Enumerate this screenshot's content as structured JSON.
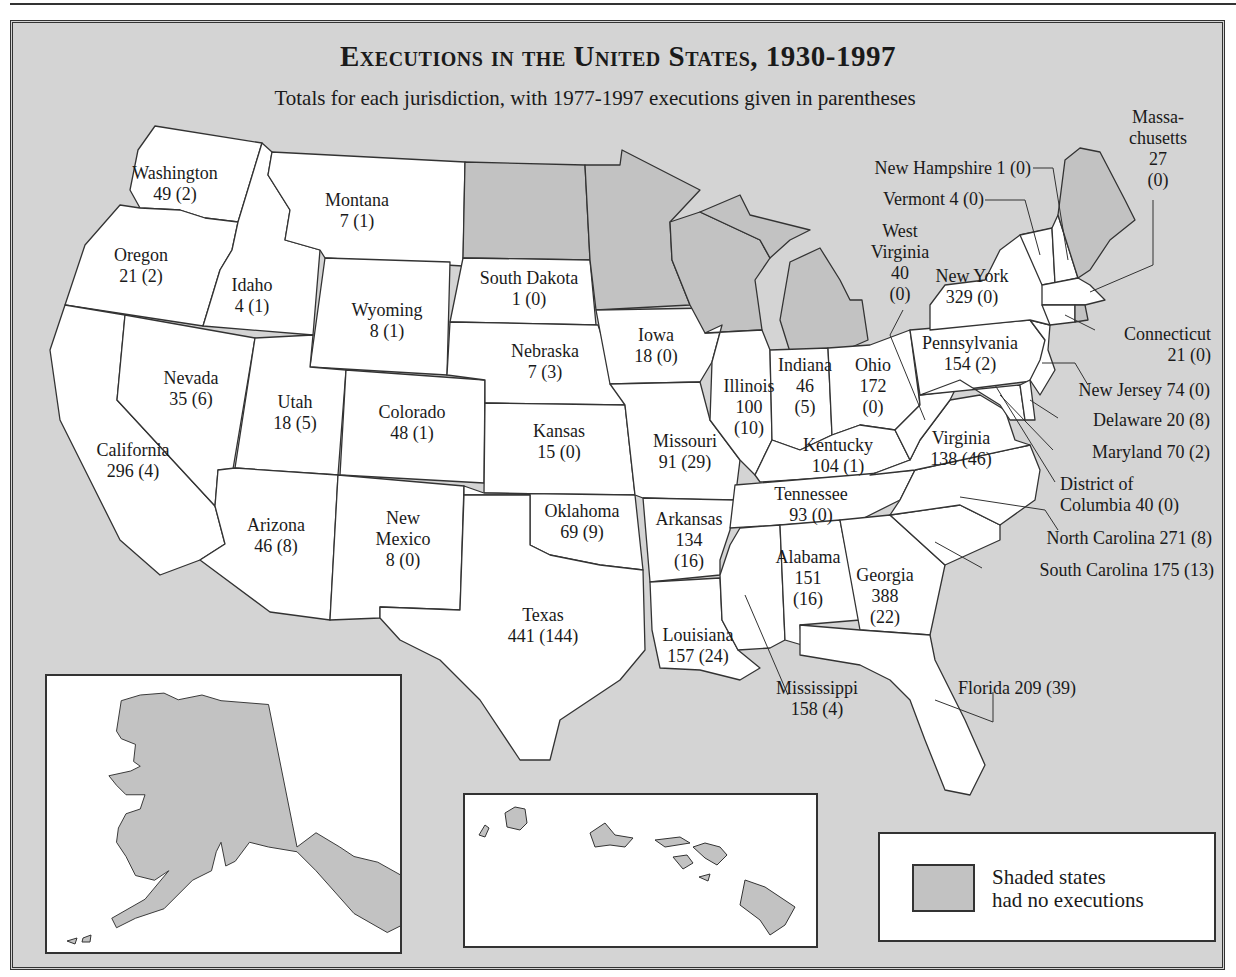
{
  "title": "Executions in the United States, 1930-1997",
  "subtitle": "Totals for each jurisdiction, with 1977-1997 executions given in parentheses",
  "legend": {
    "swatch_color": "#c2c2c2",
    "line1": "Shaded states",
    "line2": "had no executions"
  },
  "colors": {
    "background": "#d4d4d4",
    "state_fill": "#ffffff",
    "no_execution_fill": "#c2c2c2",
    "border": "#333333"
  },
  "states": {
    "washington": {
      "name": "Washington",
      "value": "49 (2)"
    },
    "oregon": {
      "name": "Oregon",
      "value": "21 (2)"
    },
    "california": {
      "name": "California",
      "value": "296 (4)"
    },
    "nevada": {
      "name": "Nevada",
      "value": "35 (6)"
    },
    "idaho": {
      "name": "Idaho",
      "value": "4 (1)"
    },
    "montana": {
      "name": "Montana",
      "value": "7 (1)"
    },
    "wyoming": {
      "name": "Wyoming",
      "value": "8 (1)"
    },
    "utah": {
      "name": "Utah",
      "value": "18 (5)"
    },
    "colorado": {
      "name": "Colorado",
      "value": "48 (1)"
    },
    "arizona": {
      "name": "Arizona",
      "value": "46 (8)"
    },
    "new_mexico": {
      "name1": "New",
      "name2": "Mexico",
      "value": "8 (0)"
    },
    "south_dakota": {
      "name": "South Dakota",
      "value": "1 (0)"
    },
    "nebraska": {
      "name": "Nebraska",
      "value": "7 (3)"
    },
    "kansas": {
      "name": "Kansas",
      "value": "15 (0)"
    },
    "oklahoma": {
      "name": "Oklahoma",
      "value": "69 (9)"
    },
    "texas": {
      "name": "Texas",
      "value": "441 (144)"
    },
    "iowa": {
      "name": "Iowa",
      "value": "18 (0)"
    },
    "missouri": {
      "name": "Missouri",
      "value": "91 (29)"
    },
    "arkansas": {
      "name": "Arkansas",
      "value1": "134",
      "value2": "(16)"
    },
    "louisiana": {
      "name": "Louisiana",
      "value": "157 (24)"
    },
    "illinois": {
      "name": "Illinois",
      "value1": "100",
      "value2": "(10)"
    },
    "indiana": {
      "name": "Indiana",
      "value1": "46",
      "value2": "(5)"
    },
    "ohio": {
      "name": "Ohio",
      "value1": "172",
      "value2": "(0)"
    },
    "kentucky": {
      "name": "Kentucky",
      "value": "104 (1)"
    },
    "tennessee": {
      "name": "Tennessee",
      "value": "93 (0)"
    },
    "mississippi": {
      "name": "Mississippi",
      "value": "158 (4)"
    },
    "alabama": {
      "name": "Alabama",
      "value1": "151",
      "value2": "(16)"
    },
    "georgia": {
      "name": "Georgia",
      "value1": "388",
      "value2": "(22)"
    },
    "florida": {
      "label": "Florida 209 (39)"
    },
    "south_carolina": {
      "label": "South Carolina 175 (13)"
    },
    "north_carolina": {
      "label": "North Carolina 271 (8)"
    },
    "virginia": {
      "name": "Virginia",
      "value": "138 (46)"
    },
    "west_virginia": {
      "name1": "West",
      "name2": "Virginia",
      "value1": "40",
      "value2": "(0)"
    },
    "pennsylvania": {
      "name": "Pennsylvania",
      "value": "154 (2)"
    },
    "new_york": {
      "name": "New York",
      "value": "329 (0)"
    },
    "vermont": {
      "label": "Vermont 4 (0)"
    },
    "new_hampshire": {
      "label": "New Hampshire 1 (0)"
    },
    "massachusetts": {
      "name1": "Massa-",
      "name2": "chusetts",
      "value1": "27",
      "value2": "(0)"
    },
    "connecticut": {
      "name": "Connecticut",
      "value": "21 (0)"
    },
    "new_jersey": {
      "label": "New Jersey 74 (0)"
    },
    "delaware": {
      "label": "Delaware 20 (8)"
    },
    "maryland": {
      "label": "Maryland 70 (2)"
    },
    "district_of_columbia": {
      "line1": "District of",
      "line2": "Columbia 40 (0)"
    }
  },
  "no_execution_states": [
    "North Dakota",
    "Minnesota",
    "Wisconsin",
    "Michigan",
    "Maine",
    "Rhode Island",
    "Alaska",
    "Hawaii"
  ]
}
